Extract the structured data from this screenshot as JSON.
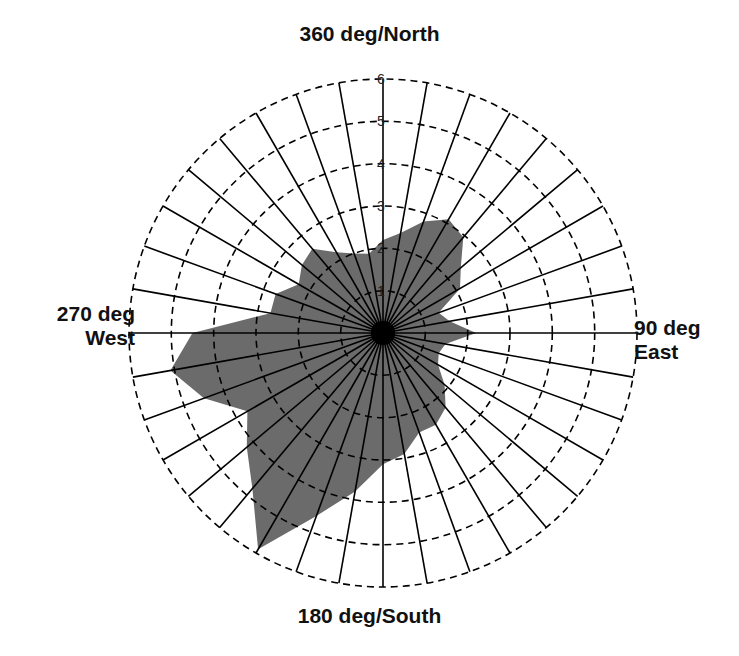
{
  "chart_data": {
    "type": "polar_area",
    "title": "",
    "direction_labels": {
      "north": "360 deg/North",
      "south": "180 deg/South",
      "west_line1": "270 deg",
      "west_line2": "West",
      "east_line1": "90 deg",
      "east_line2": "East"
    },
    "radial_axis": {
      "range": [
        0,
        6
      ],
      "ticks": [
        1,
        2,
        3,
        4,
        5,
        6
      ],
      "tick_labels": [
        "1",
        "2",
        "3",
        "4",
        "5",
        "6"
      ],
      "grid_style": "dashed circles"
    },
    "angular_axis": {
      "unit": "deg",
      "zero_at": "north",
      "direction": "clockwise",
      "spoke_step_deg": 10
    },
    "series": [
      {
        "name": "values",
        "fill_color": "#6b6b6b",
        "angles_deg": [
          0,
          10,
          20,
          30,
          40,
          50,
          60,
          70,
          80,
          90,
          100,
          110,
          120,
          130,
          140,
          150,
          160,
          170,
          180,
          190,
          200,
          210,
          220,
          230,
          240,
          250,
          260,
          270,
          280,
          290,
          300,
          310,
          320,
          330,
          340,
          350
        ],
        "values": [
          2.2,
          2.4,
          2.8,
          3.1,
          2.95,
          2.4,
          2.1,
          1.4,
          1.6,
          2.2,
          1.5,
          1.4,
          1.5,
          1.9,
          2.3,
          2.5,
          2.5,
          2.9,
          3.1,
          3.8,
          4.6,
          5.9,
          4.8,
          4.2,
          3.7,
          4.5,
          5.1,
          4.5,
          2.7,
          2.7,
          2.3,
          2.5,
          2.6,
          2.2,
          2.0,
          1.9
        ]
      }
    ],
    "colors": {
      "fill": "#6b6b6b",
      "lines": "#000000",
      "center_dot": "#000000"
    }
  }
}
